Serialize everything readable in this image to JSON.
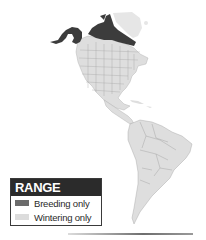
{
  "map": {
    "region": "North and South America",
    "colors": {
      "breeding": "#3c3c3c",
      "wintering": "#dedede",
      "greenland": "#e6e6e6",
      "borders": "#9a9a9a",
      "background": "#ffffff"
    }
  },
  "legend": {
    "title": "RANGE",
    "items": [
      {
        "label": "Breeding only",
        "color": "#6b6b6b"
      },
      {
        "label": "Wintering only",
        "color": "#dcdcdc"
      }
    ]
  }
}
